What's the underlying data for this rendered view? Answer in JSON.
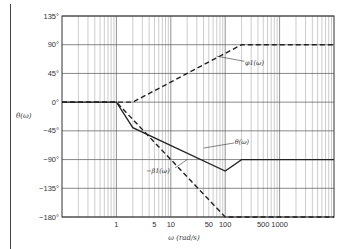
{
  "chart_data": {
    "type": "line",
    "title": "",
    "xlabel": "ω (rad/s)",
    "ylabel": "θ(ω)",
    "xscale": "log",
    "xlim": [
      0.1,
      10000
    ],
    "ylim": [
      -180,
      135
    ],
    "grid": true,
    "x_tick_labels": [
      {
        "value": 1,
        "label": "1"
      },
      {
        "value": 5,
        "label": "5"
      },
      {
        "value": 10,
        "label": "10"
      },
      {
        "value": 50,
        "label": "50"
      },
      {
        "value": 100,
        "label": "100"
      },
      {
        "value": 500,
        "label": "500"
      },
      {
        "value": 1000,
        "label": "1000"
      }
    ],
    "y_tick_labels": [
      {
        "value": 135,
        "label": "135°"
      },
      {
        "value": 90,
        "label": "90°"
      },
      {
        "value": 45,
        "label": "45°"
      },
      {
        "value": 0,
        "label": "0°"
      },
      {
        "value": -45,
        "label": "−45°"
      },
      {
        "value": -90,
        "label": "−90°"
      },
      {
        "value": -135,
        "label": "−135°"
      },
      {
        "value": -180,
        "label": "−180°"
      }
    ],
    "series": [
      {
        "name": "φ1(ω)",
        "label": "φ1(ω)",
        "style": "dashed",
        "points": [
          [
            0.1,
            0
          ],
          [
            2,
            0
          ],
          [
            200,
            90
          ],
          [
            10000,
            90
          ]
        ]
      },
      {
        "name": "−β1(ω)",
        "label": "−β1(ω)",
        "style": "dashed",
        "points": [
          [
            0.1,
            0
          ],
          [
            1,
            0
          ],
          [
            100,
            -180
          ],
          [
            10000,
            -180
          ]
        ]
      },
      {
        "name": "θ(ω)",
        "label": "θ(ω)",
        "style": "solid",
        "points": [
          [
            0.1,
            0
          ],
          [
            1,
            0
          ],
          [
            2,
            -40
          ],
          [
            100,
            -108
          ],
          [
            200,
            -90
          ],
          [
            10000,
            -90
          ]
        ]
      }
    ],
    "annotations": [
      {
        "text": "φ1(ω)",
        "series": "φ1(ω)",
        "at": [
          40,
          65
        ]
      },
      {
        "text": "θ(ω)",
        "series": "θ(ω)",
        "at": [
          20,
          -70
        ]
      },
      {
        "text": "−β1(ω)",
        "series": "−β1(ω)",
        "at": [
          5,
          -108
        ]
      }
    ]
  }
}
